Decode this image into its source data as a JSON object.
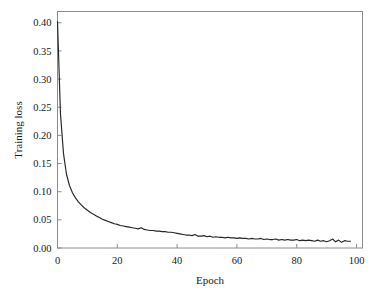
{
  "chart_data": {
    "type": "line",
    "title": "",
    "xlabel": "Epoch",
    "ylabel": "Training loss",
    "xlim": [
      0,
      102
    ],
    "ylim": [
      0.0,
      0.42
    ],
    "grid": false,
    "legend": null,
    "line_color": "#262626",
    "frame_color": "#8c8c8c",
    "background": "#ffffff",
    "xticks": [
      0,
      20,
      40,
      60,
      80,
      100
    ],
    "xtick_labels": [
      "0",
      "20",
      "40",
      "60",
      "80",
      "100"
    ],
    "yticks": [
      0.0,
      0.05,
      0.1,
      0.15,
      0.2,
      0.25,
      0.3,
      0.35,
      0.4
    ],
    "ytick_labels": [
      "0.00",
      "0.05",
      "0.10",
      "0.15",
      "0.20",
      "0.25",
      "0.30",
      "0.35",
      "0.40"
    ],
    "series": [
      {
        "name": "Training loss",
        "x": [
          0,
          1,
          2,
          3,
          4,
          5,
          6,
          7,
          8,
          9,
          10,
          11,
          12,
          13,
          14,
          15,
          16,
          17,
          18,
          19,
          20,
          21,
          22,
          23,
          24,
          25,
          26,
          27,
          28,
          29,
          30,
          31,
          32,
          33,
          34,
          35,
          36,
          37,
          38,
          39,
          40,
          41,
          42,
          43,
          44,
          45,
          46,
          47,
          48,
          49,
          50,
          51,
          52,
          53,
          54,
          55,
          56,
          57,
          58,
          59,
          60,
          61,
          62,
          63,
          64,
          65,
          66,
          67,
          68,
          69,
          70,
          71,
          72,
          73,
          74,
          75,
          76,
          77,
          78,
          79,
          80,
          81,
          82,
          83,
          84,
          85,
          86,
          87,
          88,
          89,
          90,
          91,
          92,
          93,
          94,
          95,
          96,
          97,
          98
        ],
        "values": [
          0.402,
          0.238,
          0.168,
          0.131,
          0.111,
          0.098,
          0.089,
          0.082,
          0.076,
          0.071,
          0.067,
          0.063,
          0.06,
          0.057,
          0.054,
          0.051,
          0.049,
          0.047,
          0.045,
          0.043,
          0.042,
          0.04,
          0.039,
          0.038,
          0.037,
          0.036,
          0.035,
          0.034,
          0.036,
          0.033,
          0.032,
          0.031,
          0.031,
          0.03,
          0.03,
          0.029,
          0.029,
          0.028,
          0.028,
          0.027,
          0.026,
          0.025,
          0.024,
          0.023,
          0.023,
          0.022,
          0.024,
          0.021,
          0.021,
          0.022,
          0.02,
          0.021,
          0.019,
          0.02,
          0.019,
          0.019,
          0.018,
          0.019,
          0.018,
          0.018,
          0.017,
          0.018,
          0.017,
          0.017,
          0.016,
          0.017,
          0.016,
          0.016,
          0.017,
          0.015,
          0.016,
          0.015,
          0.015,
          0.016,
          0.014,
          0.015,
          0.014,
          0.015,
          0.014,
          0.014,
          0.015,
          0.013,
          0.014,
          0.013,
          0.014,
          0.013,
          0.012,
          0.014,
          0.012,
          0.013,
          0.011,
          0.013,
          0.016,
          0.011,
          0.014,
          0.01,
          0.013,
          0.012,
          0.012
        ]
      }
    ]
  }
}
